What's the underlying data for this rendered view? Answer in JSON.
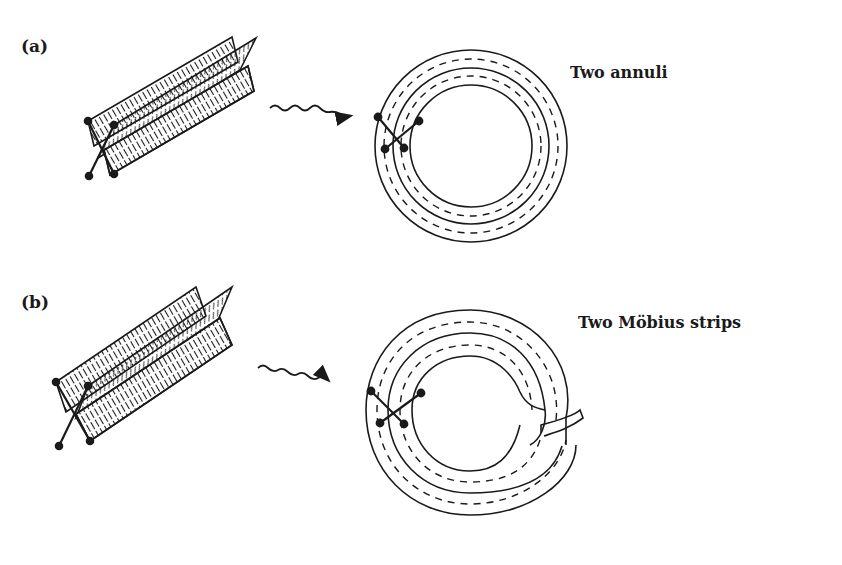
{
  "panels": [
    {
      "id": "a",
      "label": "(a)",
      "caption": "Two annuli",
      "result": "annuli"
    },
    {
      "id": "b",
      "label": "(b)",
      "caption": "Two Möbius strips",
      "result": "mobius"
    }
  ],
  "colors": {
    "ink": "#1a1a1a",
    "background": "#ffffff"
  }
}
